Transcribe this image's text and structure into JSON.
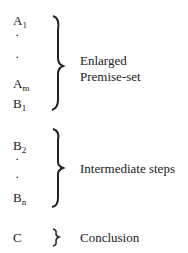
{
  "groups": [
    {
      "items": [
        "A",
        "·",
        "·",
        "A",
        "B"
      ],
      "subs": [
        "1",
        "",
        "",
        "m",
        "1"
      ],
      "label_lines": [
        "Enlarged",
        "Premise-set"
      ]
    },
    {
      "items": [
        "B",
        "·",
        "·",
        "B"
      ],
      "subs": [
        "2",
        "",
        "",
        "n"
      ],
      "label": "Intermediate steps"
    },
    {
      "items": [
        "C"
      ],
      "label": "Conclusion"
    }
  ]
}
